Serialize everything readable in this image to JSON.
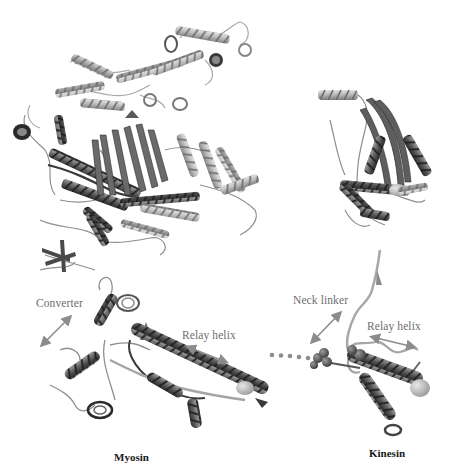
{
  "figure": {
    "panels": [
      {
        "id": "myosin-full",
        "description": "Myosin motor domain ribbon structure (full)",
        "position": "top-left"
      },
      {
        "id": "kinesin-full",
        "description": "Kinesin motor domain ribbon structure (full)",
        "position": "top-right"
      },
      {
        "id": "myosin-core",
        "description": "Myosin core: converter and relay helix",
        "position": "bottom-left"
      },
      {
        "id": "kinesin-core",
        "description": "Kinesin core: neck linker and relay helix",
        "position": "bottom-right"
      }
    ],
    "labels": {
      "converter": "Converter",
      "myosin_relay_helix": "Relay helix",
      "neck_linker": "Neck linker",
      "kinesin_relay_helix": "Relay helix"
    },
    "captions": {
      "myosin": "Myosin",
      "kinesin": "Kinesin"
    },
    "colors": {
      "background": "#ffffff",
      "helix_light": "#bdbdbd",
      "helix_mid": "#8a8a8a",
      "helix_dark": "#3c3c3c",
      "loop": "#9a9a9a",
      "arrow": "#8c8c8c",
      "label_text": "#6e6e6e",
      "caption_text": "#1a1a1a"
    }
  }
}
